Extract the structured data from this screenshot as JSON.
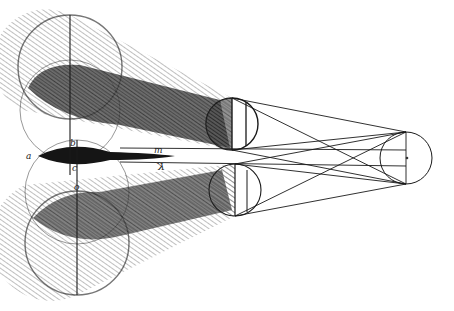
{
  "drawing": {
    "title": "Pen-and-ink optical study: two overlapping pairs of spheres casting converging shadow cones toward a small circle",
    "style": "hatched sepia pen sketch",
    "colors": {
      "paper": "#ffffff",
      "ink": "#1a1a1a",
      "hatch": "#555555",
      "shadow": "#2a2a2a"
    },
    "labels": {
      "a": "a",
      "b": "b",
      "c": "c",
      "m": "m",
      "k": "K",
      "o": "o"
    },
    "elements": {
      "large_circles": [
        {
          "cx": 70,
          "cy": 67,
          "r": 52
        },
        {
          "cx": 70,
          "cy": 110,
          "r": 50
        },
        {
          "cx": 77,
          "cy": 192,
          "r": 52
        },
        {
          "cx": 77,
          "cy": 243,
          "r": 52
        }
      ],
      "small_circles": [
        {
          "cx": 232,
          "cy": 124,
          "r": 26
        },
        {
          "cx": 235,
          "cy": 190,
          "r": 26
        }
      ],
      "target_circle": {
        "cx": 406,
        "cy": 158,
        "r": 26
      }
    }
  }
}
